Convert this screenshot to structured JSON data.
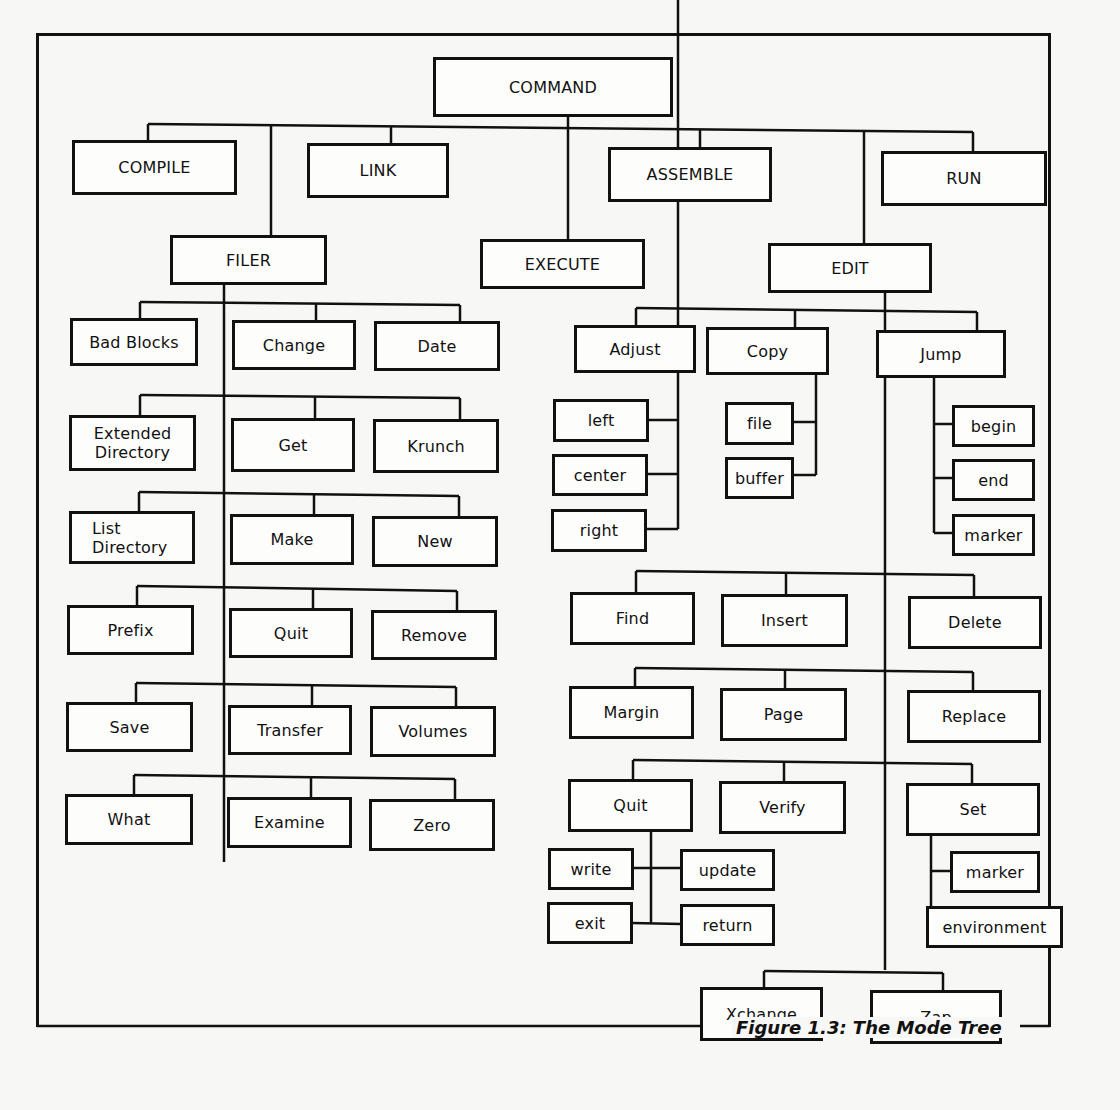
{
  "figure": {
    "caption": "Figure 1.3: The Mode Tree"
  },
  "nodes": {
    "command": "COMMAND",
    "compile": "COMPILE",
    "link": "LINK",
    "assemble": "ASSEMBLE",
    "run": "RUN",
    "filer": "FILER",
    "execute": "EXECUTE",
    "edit": "EDIT",
    "filer_children": {
      "bad_blocks": "Bad Blocks",
      "change": "Change",
      "date": "Date",
      "extended_directory": "Extended Directory",
      "get": "Get",
      "krunch": "Krunch",
      "list_directory": "List Directory",
      "make": "Make",
      "new": "New",
      "prefix": "Prefix",
      "quit": "Quit",
      "remove": "Remove",
      "save": "Save",
      "transfer": "Transfer",
      "volumes": "Volumes",
      "what": "What",
      "examine": "Examine",
      "zero": "Zero"
    },
    "edit_children": {
      "adjust": "Adjust",
      "adjust_left": "left",
      "adjust_center": "center",
      "adjust_right": "right",
      "copy": "Copy",
      "copy_file": "file",
      "copy_buffer": "buffer",
      "jump": "Jump",
      "jump_begin": "begin",
      "jump_end": "end",
      "jump_marker": "marker",
      "find": "Find",
      "insert": "Insert",
      "delete": "Delete",
      "margin": "Margin",
      "page": "Page",
      "replace": "Replace",
      "quit": "Quit",
      "quit_write": "write",
      "quit_update": "update",
      "quit_exit": "exit",
      "quit_return": "return",
      "verify": "Verify",
      "set": "Set",
      "set_marker": "marker",
      "set_environment": "environment",
      "xchange": "Xchange",
      "zap": "Zap"
    }
  }
}
